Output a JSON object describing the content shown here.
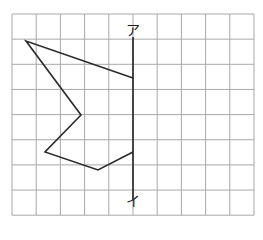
{
  "figure": {
    "title": "",
    "grid": {
      "columns": 10,
      "rows": 8,
      "origin_px": [
        12,
        14
      ],
      "cell_w_px": 24.2,
      "cell_h_px": 25.15,
      "color": "#a8a8a8"
    },
    "axis": {
      "label_top": "ア",
      "label_bottom": "イ",
      "x_px": 133,
      "y_start_px": 37,
      "y_end_px": 200,
      "color": "#222222"
    },
    "shape": {
      "description": "Half of a figure drawn on the left side of line アイ (line-symmetry exercise)",
      "points_px": [
        [
          26,
          41
        ],
        [
          133,
          78
        ],
        [
          133,
          152
        ],
        [
          98,
          170
        ],
        [
          45,
          152
        ],
        [
          81,
          115
        ]
      ],
      "open_along_axis": true,
      "color": "#2a2a2a"
    }
  }
}
